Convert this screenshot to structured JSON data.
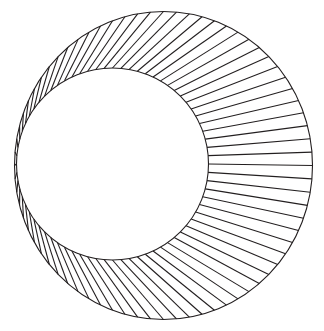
{
  "figure": {
    "title": "Tangent circles with radial chord lines",
    "type": "line-art-diagram",
    "background_color": "#ffffff",
    "stroke_color": "#231f20",
    "stroke_width": 1.1,
    "canvas": {
      "width": 324,
      "height": 331
    },
    "outer_circle": {
      "name": "outer-circle",
      "center_x": 163.5,
      "center_y": 165.5,
      "radius_x": 149,
      "radius_y": 154,
      "left_edge_x": 14.5,
      "right_edge_x": 312.5,
      "top_edge_y": 11.5,
      "bottom_edge_y": 319.5
    },
    "inner_circle": {
      "name": "inner-circle",
      "center_x": 112.5,
      "center_y": 164.0,
      "radius_x": 96,
      "radius_y": 96,
      "left_edge_x": 16.5,
      "right_edge_x": 208.5,
      "top_edge_y": 68.0,
      "bottom_edge_y": 260.0
    },
    "tangency": {
      "label": "left tangent point",
      "x": 15.5,
      "y": 165.0
    },
    "chords": {
      "count": 72,
      "angle_step_degrees": 5,
      "start_angle_degrees": 180,
      "description": "straight segments joining equally spaced points on the outer circle to equally spaced points on the inner circle"
    }
  }
}
